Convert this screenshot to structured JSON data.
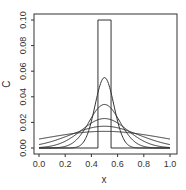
{
  "chart_data": {
    "type": "line",
    "title": "",
    "xlabel": "x",
    "ylabel": "C",
    "xlim": [
      0.0,
      1.0
    ],
    "ylim": [
      0.0,
      0.1
    ],
    "x_ticks": [
      "0.0",
      "0.2",
      "0.4",
      "0.6",
      "0.8",
      "1.0"
    ],
    "y_ticks": [
      "0.00",
      "0.02",
      "0.04",
      "0.06",
      "0.08",
      "0.10"
    ],
    "grid": false,
    "legend": null,
    "initial_pulse": {
      "x_start": 0.45,
      "x_end": 0.55,
      "height": 0.1
    },
    "series": [
      {
        "name": "t0",
        "shape": "rectangular pulse",
        "peak": 0.1,
        "center": 0.5
      },
      {
        "name": "t1",
        "shape": "gaussian",
        "peak": 0.055,
        "center": 0.5,
        "sigma": 0.072
      },
      {
        "name": "t2",
        "shape": "gaussian",
        "peak": 0.034,
        "center": 0.5,
        "sigma": 0.117
      },
      {
        "name": "t3",
        "shape": "gaussian",
        "peak": 0.023,
        "center": 0.5,
        "sigma": 0.175
      },
      {
        "name": "t4",
        "shape": "gaussian",
        "peak": 0.017,
        "center": 0.5,
        "sigma": 0.26
      },
      {
        "name": "t5",
        "shape": "gaussian",
        "peak": 0.013,
        "center": 0.5,
        "sigma": 0.45
      }
    ],
    "line_color": "#333333"
  }
}
